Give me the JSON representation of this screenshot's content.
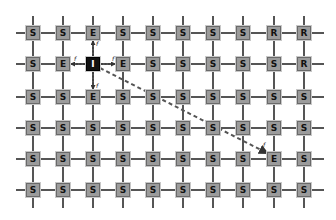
{
  "diagram": {
    "type": "mesh-grid",
    "columns": 10,
    "rows": 6,
    "col_x": [
      33,
      63,
      93,
      123,
      153,
      183,
      213,
      243,
      274,
      304
    ],
    "row_y": [
      33,
      64,
      97,
      128,
      159,
      190
    ],
    "line_color": "#555555",
    "node_fill": "#9b9b9b",
    "initiator_fill": "#111111",
    "path_color": "#555555",
    "grid": [
      [
        "S",
        "S",
        "E",
        "S",
        "S",
        "S",
        "S",
        "S",
        "R",
        "R"
      ],
      [
        "S",
        "E",
        "I",
        "E",
        "S",
        "S",
        "S",
        "S",
        "S",
        "R"
      ],
      [
        "S",
        "S",
        "E",
        "S",
        "S",
        "S",
        "S",
        "S",
        "S",
        "S"
      ],
      [
        "S",
        "S",
        "S",
        "S",
        "S",
        "S",
        "S",
        "S",
        "S",
        "S"
      ],
      [
        "S",
        "S",
        "S",
        "S",
        "S",
        "S",
        "S",
        "S",
        "E",
        "S"
      ],
      [
        "S",
        "S",
        "S",
        "S",
        "S",
        "S",
        "S",
        "S",
        "S",
        "S"
      ]
    ],
    "neighbor_arrows": [
      {
        "from": [
          1,
          2
        ],
        "to": [
          0,
          2
        ],
        "label": "f"
      },
      {
        "from": [
          1,
          2
        ],
        "to": [
          1,
          1
        ],
        "label": "f"
      },
      {
        "from": [
          1,
          2
        ],
        "to": [
          1,
          3
        ],
        "label": "f"
      },
      {
        "from": [
          1,
          2
        ],
        "to": [
          2,
          2
        ],
        "label": "f"
      }
    ],
    "dashed_path": {
      "from": [
        1,
        2
      ],
      "to": [
        4,
        8
      ],
      "label": "f"
    }
  }
}
